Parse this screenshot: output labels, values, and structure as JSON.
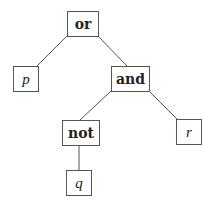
{
  "diagram": {
    "type": "expression-tree",
    "nodes": {
      "or": {
        "label": "or",
        "kind": "operator"
      },
      "p": {
        "label": "p",
        "kind": "variable"
      },
      "and": {
        "label": "and",
        "kind": "operator"
      },
      "not": {
        "label": "not",
        "kind": "operator"
      },
      "r": {
        "label": "r",
        "kind": "variable"
      },
      "q": {
        "label": "q",
        "kind": "variable"
      }
    },
    "edges": [
      [
        "or",
        "p"
      ],
      [
        "or",
        "and"
      ],
      [
        "and",
        "not"
      ],
      [
        "and",
        "r"
      ],
      [
        "not",
        "q"
      ]
    ],
    "colors": {
      "stroke": "#555555",
      "text": "#222222",
      "background": "#ffffff"
    }
  }
}
